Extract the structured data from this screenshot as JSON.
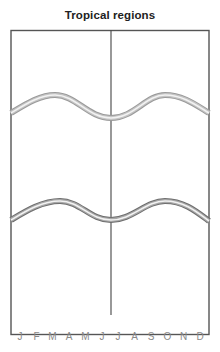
{
  "title": "Tropical regions",
  "months": [
    "J",
    "F",
    "M",
    "A",
    "M",
    "J",
    "J",
    "A",
    "S",
    "O",
    "N",
    "D"
  ],
  "colors": {
    "frame": "#555555",
    "divider": "#444444",
    "curve_upper_outer": "#9a9a9a",
    "curve_lower_outer": "#6e6e6e",
    "curve_inner": "#f2f2f2",
    "label": "#8a8a8a"
  },
  "divider": {
    "label": "mid-year divider (June/July)"
  },
  "curves": [
    {
      "name": "upper-curve",
      "description": "seasonal curve, upper band"
    },
    {
      "name": "lower-curve",
      "description": "seasonal curve, lower band"
    }
  ]
}
